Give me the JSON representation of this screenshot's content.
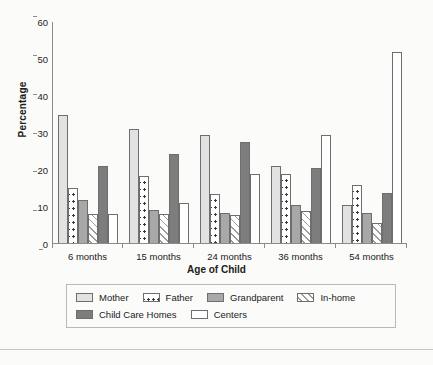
{
  "chart_data": {
    "type": "bar",
    "title": "",
    "xlabel": "Age of Child",
    "ylabel": "Percentage",
    "categories": [
      "6 months",
      "15 months",
      "24 months",
      "36 months",
      "54 months"
    ],
    "ylim": [
      0,
      60
    ],
    "yticks": [
      0,
      10,
      20,
      30,
      40,
      50,
      60
    ],
    "grid": false,
    "legend_position": "bottom",
    "series": [
      {
        "name": "Mother",
        "swatch": "light-gray-fill",
        "color": "#e2e2e2",
        "values": [
          35.0,
          31.2,
          29.4,
          21.0,
          10.5
        ]
      },
      {
        "name": "Father",
        "swatch": "white-dotted",
        "color": "#ffffff",
        "values": [
          15.2,
          18.3,
          13.4,
          18.8,
          16.0
        ]
      },
      {
        "name": "Grandparent",
        "swatch": "medium-gray-fill",
        "color": "#a8a8a8",
        "values": [
          12.0,
          9.2,
          8.4,
          10.6,
          8.5
        ]
      },
      {
        "name": "In-home",
        "swatch": "diagonal-hatch",
        "color": "#f2f2f2",
        "values": [
          8.1,
          8.0,
          7.9,
          9.0,
          5.8
        ]
      },
      {
        "name": "Child Care Homes",
        "swatch": "dark-gray-fill",
        "color": "#7d7d7d",
        "values": [
          21.2,
          24.3,
          27.6,
          20.5,
          13.9
        ]
      },
      {
        "name": "Centers",
        "swatch": "white-fill",
        "color": "#ffffff",
        "values": [
          8.1,
          11.2,
          19.0,
          29.4,
          51.8
        ]
      }
    ]
  },
  "legend": {
    "rows": [
      [
        "Mother",
        "Father",
        "Grandparent",
        "In-home"
      ],
      [
        "Child Care Homes",
        "Centers"
      ]
    ]
  }
}
